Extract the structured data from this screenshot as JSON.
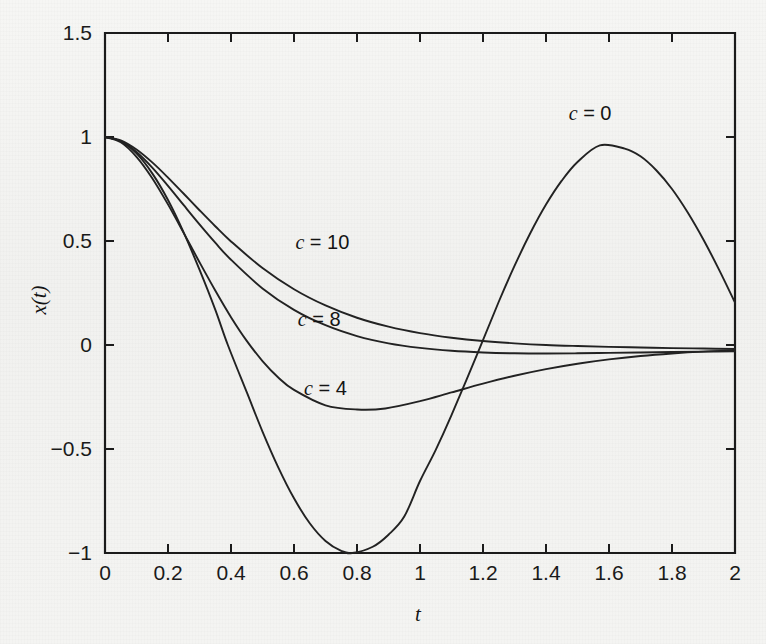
{
  "figure": {
    "background_color": "#f3f3f1",
    "ink_color": "#1b1b1b",
    "xlabel": "t",
    "ylabel": "x(t)"
  },
  "chart_data": {
    "type": "line",
    "title": "",
    "subtitle": "",
    "xlabel": "t",
    "ylabel": "x(t)",
    "xlim": [
      0,
      2
    ],
    "ylim": [
      -1,
      1.5
    ],
    "xticks": [
      0,
      0.2,
      0.4,
      0.6,
      0.8,
      1,
      1.2,
      1.4,
      1.6,
      1.8,
      2
    ],
    "xticklabels": [
      "0",
      "0.2",
      "0.4",
      "0.6",
      "0.8",
      "1",
      "1.2",
      "1.4",
      "1.6",
      "1.8",
      "2"
    ],
    "yticks": [
      -1,
      -0.5,
      0,
      0.5,
      1,
      1.5
    ],
    "yticklabels": [
      "−1",
      "−0.5",
      "0",
      "0.5",
      "1",
      "1.5"
    ],
    "grid": false,
    "legend": "inline-annotations",
    "annotations": [
      {
        "text": "c = 0",
        "x": 1.54,
        "y": 1.08
      },
      {
        "text": "c = 10",
        "x": 0.69,
        "y": 0.46
      },
      {
        "text": "c = 8",
        "x": 0.68,
        "y": 0.09
      },
      {
        "text": "c = 4",
        "x": 0.7,
        "y": -0.24
      }
    ],
    "series": [
      {
        "name": "c = 0",
        "label": "c = 0",
        "color": "#222222",
        "x": [
          0,
          0.05,
          0.1,
          0.15,
          0.2,
          0.25,
          0.3,
          0.35,
          0.39,
          0.45,
          0.5,
          0.55,
          0.6,
          0.65,
          0.7,
          0.75,
          0.785,
          0.85,
          0.9,
          0.95,
          1,
          1.05,
          1.1,
          1.18,
          1.25,
          1.3,
          1.35,
          1.4,
          1.45,
          1.5,
          1.571,
          1.65,
          1.7,
          1.75,
          1.8,
          1.85,
          1.9,
          1.95,
          2
        ],
        "y": [
          1,
          0.98,
          0.921,
          0.825,
          0.697,
          0.54,
          0.362,
          0.17,
          0.0,
          -0.227,
          -0.416,
          -0.588,
          -0.737,
          -0.857,
          -0.942,
          -0.99,
          -1.0,
          -0.97,
          -0.912,
          -0.825,
          -0.654,
          -0.504,
          -0.337,
          -0.05,
          0.208,
          0.38,
          0.537,
          0.675,
          0.79,
          0.88,
          0.96,
          0.944,
          0.907,
          0.84,
          0.75,
          0.637,
          0.506,
          0.36,
          0.204
        ],
        "note": "undamped: cos(4t) scaled; minimum -1 at t~0.785, peak ~0.96 at t~1.571, drops to ~-0.18 at t=2"
      },
      {
        "name": "c = 4",
        "label": "c = 4",
        "color": "#222222",
        "x": [
          0,
          0.05,
          0.1,
          0.15,
          0.2,
          0.25,
          0.3,
          0.35,
          0.4,
          0.45,
          0.5,
          0.55,
          0.6,
          0.7,
          0.8,
          0.89,
          1,
          1.1,
          1.2,
          1.3,
          1.4,
          1.5,
          1.6,
          1.7,
          1.8,
          1.9,
          2
        ],
        "y": [
          1,
          0.975,
          0.905,
          0.802,
          0.676,
          0.538,
          0.398,
          0.262,
          0.134,
          0.02,
          -0.077,
          -0.156,
          -0.216,
          -0.29,
          -0.31,
          -0.305,
          -0.27,
          -0.228,
          -0.186,
          -0.148,
          -0.116,
          -0.09,
          -0.069,
          -0.053,
          -0.041,
          -0.032,
          -0.026
        ]
      },
      {
        "name": "c = 8",
        "label": "c = 8",
        "color": "#222222",
        "x": [
          0,
          0.05,
          0.1,
          0.15,
          0.2,
          0.25,
          0.3,
          0.35,
          0.4,
          0.5,
          0.6,
          0.7,
          0.8,
          0.9,
          1,
          1.1,
          1.2,
          1.3,
          1.4,
          1.5,
          1.6,
          1.7,
          1.8,
          1.9,
          2
        ],
        "y": [
          1,
          0.98,
          0.928,
          0.853,
          0.765,
          0.672,
          0.58,
          0.492,
          0.41,
          0.272,
          0.169,
          0.095,
          0.043,
          0.008,
          -0.014,
          -0.028,
          -0.036,
          -0.04,
          -0.041,
          -0.04,
          -0.038,
          -0.036,
          -0.034,
          -0.032,
          -0.03
        ]
      },
      {
        "name": "c = 10",
        "label": "c = 10",
        "color": "#222222",
        "x": [
          0,
          0.05,
          0.1,
          0.15,
          0.2,
          0.25,
          0.3,
          0.35,
          0.4,
          0.5,
          0.6,
          0.7,
          0.8,
          0.9,
          1,
          1.1,
          1.2,
          1.3,
          1.4,
          1.5,
          1.6,
          1.7,
          1.8,
          1.9,
          2
        ],
        "y": [
          1,
          0.984,
          0.94,
          0.878,
          0.805,
          0.727,
          0.648,
          0.571,
          0.498,
          0.37,
          0.268,
          0.19,
          0.131,
          0.088,
          0.057,
          0.035,
          0.019,
          0.008,
          0.0,
          -0.005,
          -0.009,
          -0.012,
          -0.015,
          -0.017,
          -0.019
        ]
      }
    ]
  }
}
